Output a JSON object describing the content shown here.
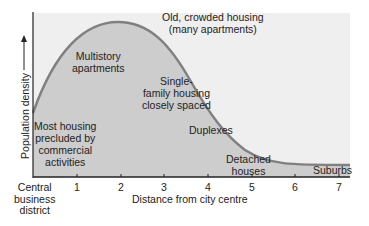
{
  "diagram": {
    "y_axis_label": "Population density",
    "x_axis_label": "Distance from city centre",
    "origin_label": [
      "Central",
      "business",
      "district"
    ],
    "x_ticks": [
      "1",
      "2",
      "3",
      "4",
      "5",
      "6",
      "7"
    ],
    "annotations": {
      "old_crowded": [
        "Old, crowded housing",
        "(many apartments)"
      ],
      "multistory": [
        "Multistory",
        "apartments"
      ],
      "single_family": [
        "Single-",
        "family housing",
        "closely spaced"
      ],
      "most_housing": [
        "Most housing",
        "precluded by",
        "commercial",
        "activities"
      ],
      "duplexes": "Duplexes",
      "detached": [
        "Detached",
        "houses"
      ],
      "suburbs": "Suburbs"
    },
    "colors": {
      "fill": "#cdcdcd",
      "curve": "#808080",
      "background": "#efefef",
      "axis": "#222222"
    }
  }
}
